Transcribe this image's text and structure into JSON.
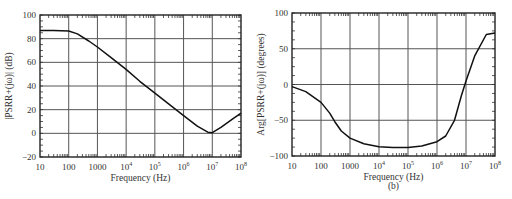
{
  "chart_data": [
    {
      "type": "line",
      "panel": "a",
      "title": "",
      "xlabel": "Frequency (Hz)",
      "ylabel": "|PSRR+(jω)| (dB)",
      "xscale": "log",
      "xlim": [
        10,
        100000000
      ],
      "ylim": [
        -20,
        100
      ],
      "grid": true,
      "xticks": [
        "10",
        "100",
        "1000",
        "10^4",
        "10^5",
        "10^6",
        "10^7",
        "10^8"
      ],
      "yticks": [
        "-20",
        "0",
        "20",
        "40",
        "60",
        "80",
        "100"
      ],
      "series": [
        {
          "name": "|PSRR+|",
          "x": [
            10,
            30,
            100,
            200,
            500,
            1000,
            3000,
            10000,
            30000,
            100000,
            300000,
            1000000,
            3000000,
            7000000,
            10000000,
            20000000,
            50000000,
            100000000
          ],
          "y": [
            87,
            87,
            86.5,
            84,
            78,
            73,
            64,
            54,
            44,
            34,
            25,
            15,
            6,
            1,
            0.5,
            5,
            12,
            17
          ]
        }
      ]
    },
    {
      "type": "line",
      "panel": "b",
      "title": "(b)",
      "xlabel": "Frequency (Hz)",
      "ylabel": "Arg[PSRR+(jω)] (degrees)",
      "xscale": "log",
      "xlim": [
        10,
        100000000
      ],
      "ylim": [
        -100,
        100
      ],
      "grid": true,
      "xticks": [
        "10",
        "100",
        "1000",
        "10^4",
        "10^5",
        "10^6",
        "10^7",
        "10^8"
      ],
      "yticks": [
        "-100",
        "-50",
        "0",
        "50",
        "100"
      ],
      "series": [
        {
          "name": "Arg PSRR+",
          "x": [
            10,
            30,
            100,
            200,
            300,
            500,
            1000,
            3000,
            10000,
            30000,
            100000,
            300000,
            1000000,
            2000000,
            4000000,
            7000000,
            10000000,
            20000000,
            50000000,
            100000000
          ],
          "y": [
            -3,
            -10,
            -25,
            -40,
            -52,
            -65,
            -75,
            -83,
            -87,
            -88,
            -88,
            -86,
            -80,
            -72,
            -50,
            -15,
            5,
            40,
            70,
            72
          ]
        }
      ]
    }
  ],
  "panels": {
    "a": {
      "ylabel": "|PSRR+(jω)| (dB)",
      "xlabel": "Frequency (Hz)",
      "yticks": [
        "100",
        "80",
        "60",
        "40",
        "20",
        "0",
        "−20"
      ],
      "xticks": [
        {
          "base": "10",
          "exp": ""
        },
        {
          "base": "100",
          "exp": ""
        },
        {
          "base": "1000",
          "exp": ""
        },
        {
          "base": "10",
          "exp": "4"
        },
        {
          "base": "10",
          "exp": "5"
        },
        {
          "base": "10",
          "exp": "6"
        },
        {
          "base": "10",
          "exp": "7"
        },
        {
          "base": "10",
          "exp": "8"
        }
      ]
    },
    "b": {
      "ylabel": "Arg[PSRR+(jω)] (degrees)",
      "xlabel": "Frequency (Hz)",
      "caption": "(b)",
      "yticks": [
        "100",
        "50",
        "0",
        "−50",
        "−100"
      ],
      "xticks": [
        {
          "base": "10",
          "exp": ""
        },
        {
          "base": "100",
          "exp": ""
        },
        {
          "base": "1000",
          "exp": ""
        },
        {
          "base": "10",
          "exp": "4"
        },
        {
          "base": "10",
          "exp": "5"
        },
        {
          "base": "10",
          "exp": "6"
        },
        {
          "base": "10",
          "exp": "7"
        },
        {
          "base": "10",
          "exp": "8"
        }
      ]
    }
  }
}
